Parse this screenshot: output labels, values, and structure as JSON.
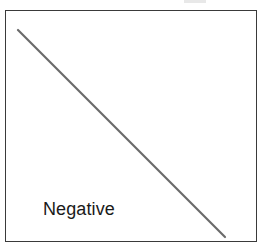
{
  "diagram": {
    "type": "correlation-example",
    "panel_label": "Negative",
    "line": {
      "direction": "descending",
      "start": [
        18,
        30
      ],
      "end": [
        225,
        237
      ],
      "color": "#6a6a6a"
    },
    "frame_color": "#3a3a3a"
  }
}
